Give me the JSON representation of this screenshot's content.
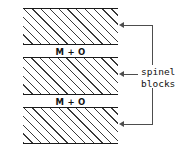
{
  "diagram": {
    "background_color": "#ffffff",
    "line_color": "#4d4d4d",
    "hatch_color": "#3a3a3a",
    "border_color": "#1a1a1a",
    "blocks": [
      {
        "id": "block-1",
        "fill": "diagonal-hatch",
        "label": ""
      },
      {
        "id": "block-2",
        "fill": "diagonal-hatch",
        "label": ""
      },
      {
        "id": "block-3",
        "fill": "diagonal-hatch",
        "label": ""
      }
    ],
    "interlayers": [
      {
        "id": "mo-band-1",
        "label": "M + O"
      },
      {
        "id": "mo-band-2",
        "label": "M + O"
      }
    ],
    "annotation": {
      "label_line_1": "spinel",
      "label_line_2": "blocks",
      "arrow_count": 3,
      "arrow_direction": "left"
    }
  }
}
